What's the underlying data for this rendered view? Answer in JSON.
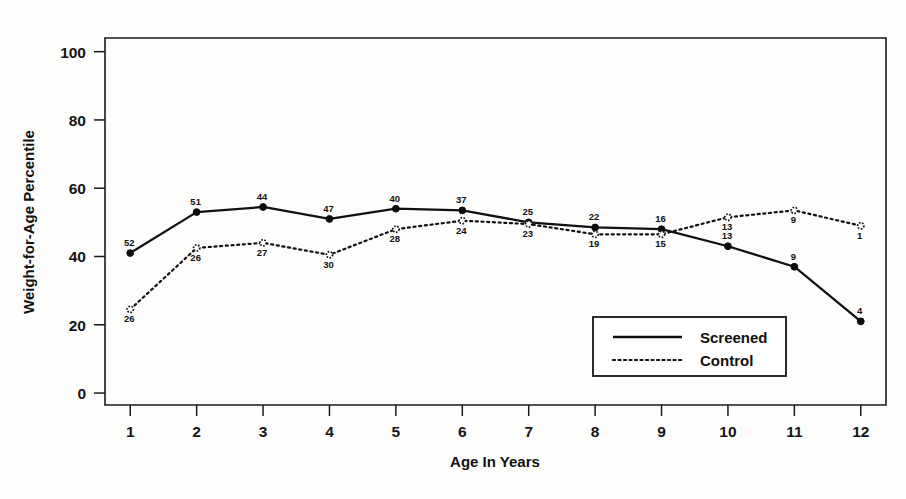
{
  "chart_data": {
    "type": "line",
    "title": "",
    "xlabel": "Age In Years",
    "ylabel": "Weight-for-Age Percentile",
    "x": [
      1,
      2,
      3,
      4,
      5,
      6,
      7,
      8,
      9,
      10,
      11,
      12
    ],
    "xtick_labels": [
      "1",
      "2",
      "3",
      "4",
      "5",
      "6",
      "7",
      "8",
      "9",
      "10",
      "11",
      "12"
    ],
    "ytick_labels": [
      "0",
      "20",
      "40",
      "60",
      "80",
      "100"
    ],
    "yticks": [
      0,
      20,
      40,
      60,
      80,
      100
    ],
    "xlim": [
      0.62,
      12.38
    ],
    "ylim": [
      -3.5,
      104
    ],
    "grid": false,
    "legend_position": "lower-right",
    "series": [
      {
        "name": "Screened",
        "style": "solid",
        "values": [
          41,
          53,
          54.5,
          51,
          54,
          53.5,
          50,
          48.5,
          48,
          43,
          37,
          21
        ],
        "point_labels": [
          "52",
          "51",
          "44",
          "47",
          "40",
          "37",
          "25",
          "22",
          "16",
          "13",
          "9",
          "4"
        ]
      },
      {
        "name": "Control",
        "style": "dotted",
        "values": [
          24.5,
          42.5,
          44,
          40.5,
          48,
          50.5,
          49.5,
          46.5,
          46.5,
          51.5,
          53.5,
          49
        ],
        "point_labels": [
          "26",
          "26",
          "27",
          "30",
          "28",
          "24",
          "23",
          "19",
          "15",
          "13",
          "9",
          "1"
        ]
      }
    ]
  },
  "legend": {
    "entries": [
      {
        "label": "Screened",
        "style": "solid"
      },
      {
        "label": "Control",
        "style": "dotted"
      }
    ]
  },
  "colors": {
    "ink": "#111111",
    "background": "#fdfdfc"
  }
}
